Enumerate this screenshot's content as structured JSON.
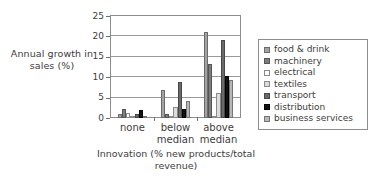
{
  "chart_data": {
    "type": "bar",
    "title": "",
    "xlabel": "Innovation (% new products/total revenue)",
    "ylabel": "Annual growth in sales (%)",
    "categories": [
      "none",
      "below median",
      "above median"
    ],
    "category_lines": [
      [
        "none"
      ],
      [
        "below",
        "median"
      ],
      [
        "above",
        "median"
      ]
    ],
    "ylim": [
      0,
      25
    ],
    "yticks": [
      0,
      5,
      10,
      15,
      20,
      25
    ],
    "ytick_labels": [
      "0",
      "5",
      "10",
      "15",
      "20",
      "25"
    ],
    "grid": true,
    "legend_position": "right",
    "series": [
      {
        "name": "food & drink",
        "color": "#a3a3a3",
        "values": [
          1.0,
          6.8,
          21.0
        ]
      },
      {
        "name": "machinery",
        "color": "#7d7d7d",
        "values": [
          2.1,
          1.1,
          13.2
        ]
      },
      {
        "name": "electrical",
        "color": "#ffffff",
        "values": [
          1.3,
          0.4,
          0.3
        ]
      },
      {
        "name": "textiles",
        "color": "#dcdcdc",
        "values": [
          0.3,
          2.6,
          6.2
        ]
      },
      {
        "name": "transport",
        "color": "#6a6a6a",
        "values": [
          0.9,
          8.9,
          19.0
        ]
      },
      {
        "name": "distribution",
        "color": "#111111",
        "values": [
          2.0,
          2.2,
          10.2
        ]
      },
      {
        "name": "business services",
        "color": "#b8b8b8",
        "values": [
          0.2,
          4.1,
          9.2
        ]
      }
    ]
  },
  "legend": {
    "items": [
      {
        "label": "food & drink"
      },
      {
        "label": "machinery"
      },
      {
        "label": "electrical"
      },
      {
        "label": "textiles"
      },
      {
        "label": "transport"
      },
      {
        "label": "distribution"
      },
      {
        "label": "business services"
      }
    ]
  }
}
